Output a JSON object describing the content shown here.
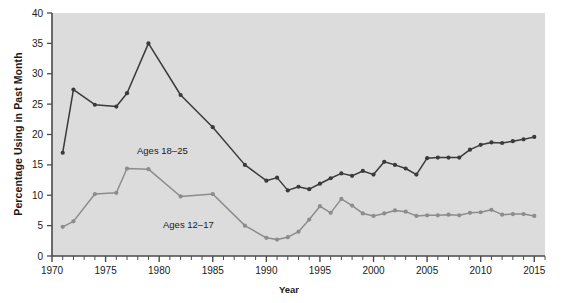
{
  "chart_data": {
    "type": "line",
    "title": "",
    "xlabel": "Year",
    "ylabel": "Percentage Using in Past Month",
    "xlim": [
      1970,
      2016
    ],
    "ylim": [
      0,
      40
    ],
    "yticks": [
      0,
      5,
      10,
      15,
      20,
      25,
      30,
      35,
      40
    ],
    "xticks_labeled": [
      1970,
      1975,
      1980,
      1985,
      1990,
      1995,
      2000,
      2005,
      2010,
      2015
    ],
    "xtick_interval": 1,
    "grid": false,
    "legend_position": "inline-annotation",
    "plot_background": "#dcdcdc",
    "series": [
      {
        "name": "Ages 18-25",
        "annotation": "Ages 18–25",
        "color": "#3a3a3a",
        "x": [
          1971,
          1972,
          1974,
          1976,
          1977,
          1979,
          1982,
          1985,
          1988,
          1990,
          1991,
          1992,
          1993,
          1994,
          1995,
          1996,
          1997,
          1998,
          1999,
          2000,
          2001,
          2002,
          2003,
          2004,
          2005,
          2006,
          2007,
          2008,
          2009,
          2010,
          2011,
          2012,
          2013,
          2014,
          2015
        ],
        "values": [
          17.0,
          27.4,
          24.9,
          24.6,
          26.8,
          35.0,
          26.5,
          21.2,
          15.0,
          12.4,
          12.9,
          10.8,
          11.4,
          11.0,
          11.9,
          12.8,
          13.6,
          13.2,
          14.0,
          13.4,
          15.5,
          15.0,
          14.4,
          13.4,
          16.1,
          16.2,
          16.2,
          16.2,
          17.5,
          18.3,
          18.7,
          18.6,
          18.9,
          19.2,
          19.6
        ]
      },
      {
        "name": "Ages 12-17",
        "annotation": "Ages 12–17",
        "color": "#8c8c8c",
        "x": [
          1971,
          1972,
          1974,
          1976,
          1977,
          1979,
          1982,
          1985,
          1988,
          1990,
          1991,
          1992,
          1993,
          1994,
          1995,
          1996,
          1997,
          1998,
          1999,
          2000,
          2001,
          2002,
          2003,
          2004,
          2005,
          2006,
          2007,
          2008,
          2009,
          2010,
          2011,
          2012,
          2013,
          2014,
          2015
        ],
        "values": [
          4.8,
          5.7,
          10.2,
          10.4,
          14.4,
          14.3,
          9.8,
          10.2,
          5.0,
          3.0,
          2.7,
          3.1,
          4.0,
          6.0,
          8.2,
          7.1,
          9.4,
          8.3,
          7.0,
          6.6,
          7.0,
          7.5,
          7.3,
          6.6,
          6.7,
          6.7,
          6.8,
          6.7,
          7.1,
          7.2,
          7.6,
          6.8,
          6.9,
          6.9,
          6.6
        ]
      }
    ]
  },
  "axes": {
    "ylabel": "Percentage Using in Past Month",
    "xlabel": "Year",
    "ytick_labels": [
      "0",
      "5",
      "10",
      "15",
      "20",
      "25",
      "30",
      "35",
      "40"
    ],
    "xtick_labels": [
      "1970",
      "1975",
      "1980",
      "1985",
      "1990",
      "1995",
      "2000",
      "2005",
      "2010",
      "2015"
    ]
  },
  "annotations": {
    "upper_series_label": "Ages 18–25",
    "lower_series_label": "Ages 12–17"
  }
}
